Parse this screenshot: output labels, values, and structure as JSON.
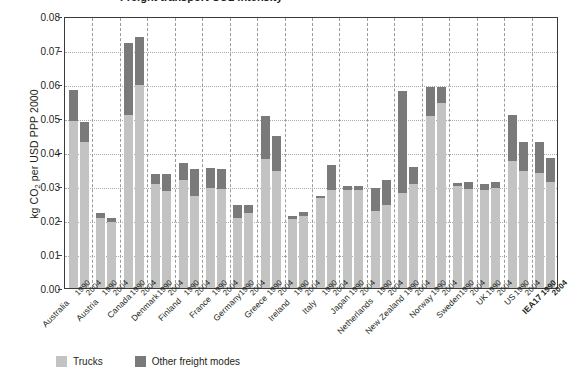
{
  "title": "Freight transport CO2 intensity",
  "legend": {
    "position": "bottom-left",
    "items": [
      {
        "label": "Trucks",
        "color": "#c3c3c3",
        "name": "trucks"
      },
      {
        "label": "Other freight modes",
        "color": "#7a7a7a",
        "name": "other-freight-modes"
      }
    ]
  },
  "chart_data": {
    "type": "bar",
    "stacked": true,
    "title": "",
    "xlabel": "",
    "ylabel": "kg CO2 per USD PPP 2000",
    "ylabel_display": "kg CO₂ per USD PPP 2000",
    "ylim": [
      0,
      0.08
    ],
    "yticks": [
      "0.00",
      "0.01",
      "0.02",
      "0.03",
      "0.04",
      "0.05",
      "0.06",
      "0.07",
      "0.08"
    ],
    "ytick_values": [
      0,
      0.01,
      0.02,
      0.03,
      0.04,
      0.05,
      0.06,
      0.07,
      0.08
    ],
    "grid": "horizontal-dotted",
    "group_labels": [
      "Australia",
      "Austria",
      "Canada",
      "Denmark",
      "Finland",
      "France",
      "Germany",
      "Greece",
      "Ireland",
      "Italy",
      "Japan",
      "Netherlands",
      "New Zealand",
      "Norway",
      "Sweden",
      "UK",
      "US",
      "IEA17"
    ],
    "bold_group": "IEA17",
    "year_labels": [
      "1990",
      "2004"
    ],
    "categories": [
      "Australia 1990",
      "Australia 2004",
      "Austria 1990",
      "Austria 2004",
      "Canada 1990",
      "Canada 2004",
      "Denmark 1990",
      "Denmark 2004",
      "Finland 1990",
      "Finland 2004",
      "France 1990",
      "France 2004",
      "Germany 1990",
      "Germany 2004",
      "Greece 1990",
      "Greece 2004",
      "Ireland 1990",
      "Ireland 2004",
      "Italy 1990",
      "Italy 2004",
      "Japan 1990",
      "Japan 2004",
      "Netherlands 1990",
      "Netherlands 2004",
      "New Zealand 1990",
      "New Zealand 2004",
      "Norway 1990",
      "Norway 2004",
      "Sweden 1990",
      "Sweden 2004",
      "UK 1990",
      "UK 2004",
      "US 1990",
      "US 2004",
      "IEA17 1990",
      "IEA17 2004"
    ],
    "series": [
      {
        "name": "Trucks",
        "color": "#c3c3c3",
        "values": [
          0.0492,
          0.0428,
          0.0205,
          0.0194,
          0.051,
          0.0597,
          0.0305,
          0.0285,
          0.0318,
          0.027,
          0.0293,
          0.0292,
          0.0207,
          0.0221,
          0.038,
          0.0345,
          0.0202,
          0.0213,
          0.0264,
          0.0288,
          0.0289,
          0.0288,
          0.0227,
          0.0245,
          0.0278,
          0.0306,
          0.0507,
          0.0543,
          0.03,
          0.0292,
          0.0289,
          0.0295,
          0.0375,
          0.0345,
          0.0338,
          0.0312
        ]
      },
      {
        "name": "Other freight modes",
        "color": "#7a7a7a",
        "values": [
          0.0091,
          0.006,
          0.0017,
          0.0013,
          0.021,
          0.0142,
          0.003,
          0.005,
          0.0049,
          0.008,
          0.0061,
          0.0059,
          0.0036,
          0.0023,
          0.0125,
          0.0103,
          0.0009,
          0.0011,
          0.0006,
          0.0073,
          0.0012,
          0.0012,
          0.0066,
          0.0073,
          0.03,
          0.005,
          0.0083,
          0.0048,
          0.001,
          0.002,
          0.0018,
          0.0018,
          0.0134,
          0.0085,
          0.0092,
          0.007
        ]
      }
    ],
    "totals": [
      0.0583,
      0.0488,
      0.0222,
      0.0207,
      0.072,
      0.0739,
      0.0335,
      0.0335,
      0.0367,
      0.035,
      0.0354,
      0.0351,
      0.0243,
      0.0244,
      0.0505,
      0.0448,
      0.0211,
      0.0224,
      0.027,
      0.0361,
      0.0301,
      0.03,
      0.0293,
      0.0318,
      0.0578,
      0.0356,
      0.059,
      0.0591,
      0.031,
      0.0312,
      0.0307,
      0.0313,
      0.0509,
      0.043,
      0.043,
      0.0382
    ]
  }
}
